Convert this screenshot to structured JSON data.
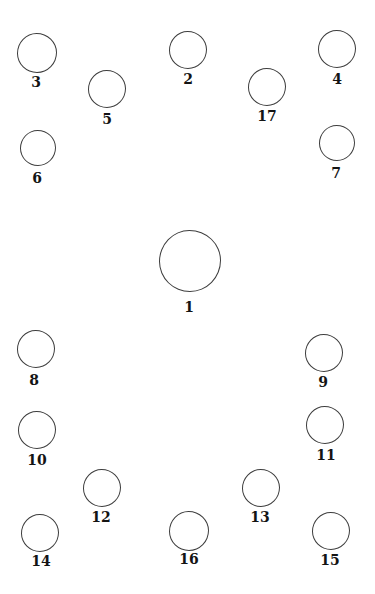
{
  "diagram": {
    "type": "labeled-circle-figure",
    "background_color": "#ffffff",
    "stroke_color": "#3d3d3d",
    "label_color": "#141414",
    "circles": [
      {
        "label": "1",
        "cx": 190,
        "cy": 261,
        "r": 31,
        "label_x": 189,
        "label_y": 300
      },
      {
        "label": "2",
        "cx": 188,
        "cy": 50,
        "r": 19,
        "label_x": 188,
        "label_y": 72
      },
      {
        "label": "3",
        "cx": 37,
        "cy": 53,
        "r": 20,
        "label_x": 36,
        "label_y": 75
      },
      {
        "label": "4",
        "cx": 337,
        "cy": 49,
        "r": 19,
        "label_x": 337,
        "label_y": 72
      },
      {
        "label": "5",
        "cx": 107,
        "cy": 89,
        "r": 19,
        "label_x": 107,
        "label_y": 112
      },
      {
        "label": "6",
        "cx": 38,
        "cy": 148,
        "r": 18,
        "label_x": 37,
        "label_y": 171
      },
      {
        "label": "7",
        "cx": 337,
        "cy": 143,
        "r": 18,
        "label_x": 336,
        "label_y": 166
      },
      {
        "label": "8",
        "cx": 36,
        "cy": 349,
        "r": 19,
        "label_x": 34,
        "label_y": 373
      },
      {
        "label": "9",
        "cx": 324,
        "cy": 353,
        "r": 19,
        "label_x": 323,
        "label_y": 375
      },
      {
        "label": "10",
        "cx": 37,
        "cy": 430,
        "r": 19,
        "label_x": 37,
        "label_y": 453
      },
      {
        "label": "11",
        "cx": 325,
        "cy": 425,
        "r": 19,
        "label_x": 326,
        "label_y": 448
      },
      {
        "label": "12",
        "cx": 102,
        "cy": 488,
        "r": 19,
        "label_x": 101,
        "label_y": 510
      },
      {
        "label": "13",
        "cx": 261,
        "cy": 488,
        "r": 19,
        "label_x": 260,
        "label_y": 510
      },
      {
        "label": "14",
        "cx": 40,
        "cy": 533,
        "r": 19,
        "label_x": 41,
        "label_y": 554
      },
      {
        "label": "15",
        "cx": 331,
        "cy": 531,
        "r": 19,
        "label_x": 330,
        "label_y": 553
      },
      {
        "label": "16",
        "cx": 189,
        "cy": 531,
        "r": 20,
        "label_x": 189,
        "label_y": 552
      },
      {
        "label": "17",
        "cx": 267,
        "cy": 87,
        "r": 19,
        "label_x": 267,
        "label_y": 109
      }
    ]
  }
}
